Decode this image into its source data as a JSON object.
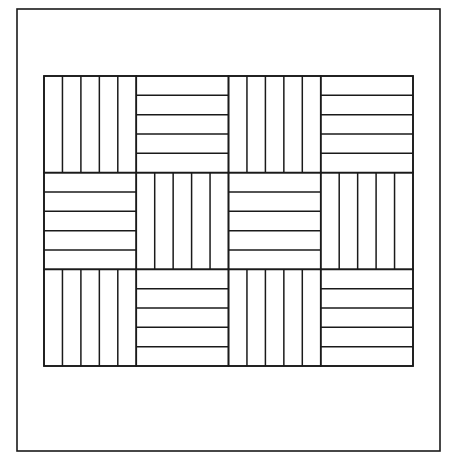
{
  "figure": {
    "stroke_color": "#1a1a1a",
    "background_color": "#ffffff",
    "outer_frame": {
      "x1": 17,
      "y1": 9,
      "x2": 440,
      "y2": 451
    },
    "grid": {
      "x": 44,
      "y": 76,
      "width": 369,
      "height": 290,
      "columns": 4,
      "rows": 3,
      "strips_per_tile": 5,
      "tile_orientations": [
        [
          "vertical",
          "horizontal",
          "vertical",
          "horizontal"
        ],
        [
          "horizontal",
          "vertical",
          "horizontal",
          "vertical"
        ],
        [
          "vertical",
          "horizontal",
          "vertical",
          "horizontal"
        ]
      ]
    }
  }
}
